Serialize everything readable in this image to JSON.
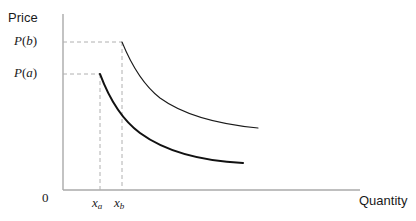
{
  "figure": {
    "width": 416,
    "height": 221,
    "background": "#ffffff"
  },
  "labels": {
    "price_axis": "Price",
    "quantity_axis": "Quantity",
    "origin": "0",
    "ytick_pb_fn": "P",
    "ytick_pb_arg": "b",
    "ytick_pa_fn": "P",
    "ytick_pa_arg": "a",
    "xtick_xa_base": "x",
    "xtick_xa_sub": "a",
    "xtick_xb_base": "x",
    "xtick_xb_sub": "b"
  },
  "colors": {
    "axis": "#aaaaaa",
    "guide_dash": "#b0b0b0",
    "curve_thin": "#1a1a1a",
    "curve_thick": "#111111",
    "text": "#1a1a1a"
  },
  "chart_data": {
    "type": "line",
    "title": "",
    "xlabel": "Quantity",
    "ylabel": "Price",
    "grid": false,
    "legend": null,
    "axis_pixels": {
      "x_origin": 63,
      "y_baseline": 190,
      "y_top": 14,
      "x_right": 360
    },
    "annotations": [
      {
        "name": "P(b)",
        "kind": "y-tick",
        "y_px": 42
      },
      {
        "name": "P(a)",
        "kind": "y-tick",
        "y_px": 74
      },
      {
        "name": "x_a",
        "kind": "x-tick",
        "x_px": 100
      },
      {
        "name": "x_b",
        "kind": "x-tick",
        "x_px": 122
      }
    ],
    "guides": [
      {
        "name": "pb-horizontal",
        "style": "dashed",
        "x1": 63,
        "y1": 42,
        "x2": 122,
        "y2": 42
      },
      {
        "name": "pa-horizontal",
        "style": "dashed",
        "x1": 63,
        "y1": 74,
        "x2": 100,
        "y2": 74
      },
      {
        "name": "xa-vertical",
        "style": "dashed",
        "x1": 100,
        "y1": 74,
        "x2": 100,
        "y2": 190
      },
      {
        "name": "xb-vertical",
        "style": "dashed",
        "x1": 122,
        "y1": 42,
        "x2": 122,
        "y2": 190
      }
    ],
    "series": [
      {
        "name": "upper-curve",
        "label": "Curve starting at (x_b, P(b))",
        "width": 1.1,
        "start": {
          "x_px": 122,
          "y_px": 42
        },
        "end": {
          "x_px": 258,
          "y_px": 128
        },
        "path": "M122,42 C131,64 142,84 160,98 C182,114 216,124 258,128"
      },
      {
        "name": "lower-curve",
        "label": "Curve starting at (x_a, P(a))",
        "width": 2.1,
        "start": {
          "x_px": 100,
          "y_px": 74
        },
        "end": {
          "x_px": 243,
          "y_px": 163
        },
        "path": "M100,74 C109,98 121,119 140,133 C166,152 203,161 243,163"
      }
    ]
  }
}
